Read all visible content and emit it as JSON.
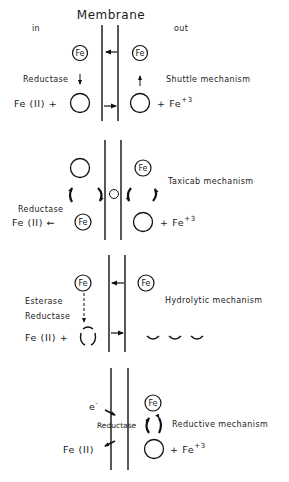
{
  "diagram": {
    "title": "Membrane",
    "side_labels": {
      "inside": "in",
      "outside": "out"
    },
    "ion_label": "Fe",
    "panels": [
      {
        "name": "Shuttle mechanism",
        "left_enzyme": "Reductase",
        "product_label": "Fe (II) +",
        "outside_species": "+ Fe",
        "outside_charge": "+3"
      },
      {
        "name": "Taxicab mechanism",
        "left_enzyme": "Reductase",
        "product_label": "Fe (II) ←",
        "outside_species": "+ Fe",
        "outside_charge": "+3"
      },
      {
        "name": "Hydrolytic mechanism",
        "left_enzyme_1": "Esterase",
        "left_enzyme_2": "Reductase",
        "product_label": "Fe (II) +"
      },
      {
        "name": "Reductive mechanism",
        "electron_label": "e",
        "electron_charge": "-",
        "enzyme": "Reductase",
        "product_label": "Fe (II)",
        "outside_species": "+ Fe",
        "outside_charge": "+3"
      }
    ]
  }
}
